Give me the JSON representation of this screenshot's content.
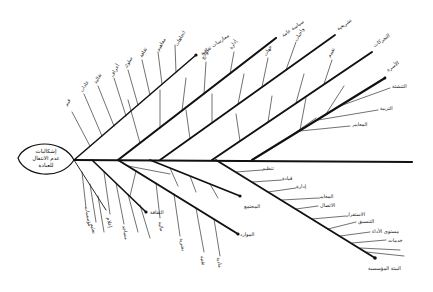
{
  "diagram": {
    "type": "fishbone",
    "head": {
      "label_line1": "إشكاليات",
      "label_line2": "عدم الانتقال",
      "label_line3": "للعبادة"
    },
    "colors": {
      "ink": "#111111",
      "background": "#ffffff"
    },
    "upper_bones": [
      {
        "label": "ممارسات ثقافية",
        "ribs": [
          "قيم",
          "عادات",
          "تقاليد",
          "أعراف",
          "سلوك",
          "ثقافة",
          "مفاهيم",
          "اتجاهات"
        ]
      },
      {
        "label": "سياسة عامة",
        "ribs": [
          "قوانين",
          "تشريعات",
          "تنظيم",
          "لوائح",
          "إدارة"
        ]
      },
      {
        "label": "تشريعية",
        "ribs": [
          "نظام",
          "موارد",
          "أنظمة",
          "جهات",
          "واجبات"
        ]
      },
      {
        "label": "التحركات",
        "ribs": [
          "تخطيط",
          "تنفيذ",
          "متابعة",
          "تقييم"
        ]
      },
      {
        "label": "الأسرة",
        "ribs": [
          "التنشئة",
          "التربية",
          "المعايير",
          "الأحوال",
          "الاقتصاد"
        ]
      }
    ],
    "lower_bones": [
      {
        "label": "الثقافة",
        "ribs": [
          "مؤسسات",
          "تعليم",
          "إعلام",
          "مساجد",
          "جمعيات",
          "مدارس"
        ]
      },
      {
        "label": "الموارد",
        "ribs": [
          "مالية",
          "بشرية",
          "تقنية",
          "مادية"
        ]
      },
      {
        "label": "المجتمع",
        "ribs": [
          "مواطنة",
          "مشاركة",
          "انتماء"
        ]
      },
      {
        "label": "البيئة المؤسسية",
        "ribs": [
          "تنظيم",
          "قيادة",
          "إدارة",
          "المعايير",
          "الاتصال",
          "الاستقرار",
          "التنسيق",
          "مستوى الأداء",
          "خدمات"
        ]
      }
    ]
  }
}
